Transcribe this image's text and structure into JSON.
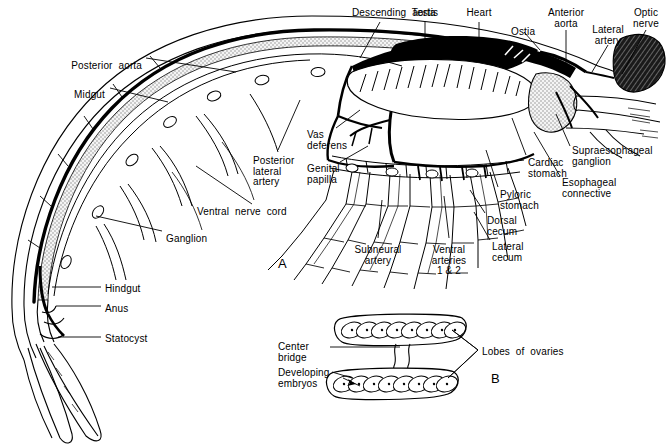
{
  "figure": {
    "background_color": "#ffffff",
    "ink_color": "#000000",
    "stipple_color": "#9a9a9a",
    "panels": [
      {
        "id": "A",
        "label": "A",
        "x": 278,
        "y": 256,
        "description": "Lateral view of whole shrimp showing circulatory, digestive and nervous systems"
      },
      {
        "id": "B",
        "label": "B",
        "x": 491,
        "y": 371,
        "description": "Detail of ovaries with developing embryos"
      }
    ]
  },
  "panel_a_labels": [
    {
      "key": "descending_aorta",
      "text": "Descending  aorta",
      "x": 352,
      "y": 8,
      "align": "left"
    },
    {
      "key": "testis",
      "text": "Testis",
      "x": 425,
      "y": 8,
      "align": "ctr"
    },
    {
      "key": "heart",
      "text": "Heart",
      "x": 479,
      "y": 8,
      "align": "ctr"
    },
    {
      "key": "ostia",
      "text": "Ostia",
      "x": 511,
      "y": 27,
      "align": "left"
    },
    {
      "key": "anterior_aorta",
      "text": "Anterior\naorta",
      "x": 566,
      "y": 8,
      "align": "ctr"
    },
    {
      "key": "lateral_artery",
      "text": "Lateral\nartery",
      "x": 608,
      "y": 25,
      "align": "ctr"
    },
    {
      "key": "optic_nerve",
      "text": "Optic\nnerve",
      "x": 646,
      "y": 8,
      "align": "ctr"
    },
    {
      "key": "posterior_aorta",
      "text": "Posterior  aorta",
      "x": 142,
      "y": 61,
      "align": "rt"
    },
    {
      "key": "midgut",
      "text": "Midgut",
      "x": 105,
      "y": 90,
      "align": "rt"
    },
    {
      "key": "vas_deferens",
      "text": "Vas\ndeferens",
      "x": 307,
      "y": 130,
      "align": "left"
    },
    {
      "key": "posterior_lateral_artery",
      "text": "Posterior\nlateral\nartery",
      "x": 253,
      "y": 156,
      "align": "left"
    },
    {
      "key": "genital_papilla",
      "text": "Genital\npapilla",
      "x": 307,
      "y": 164,
      "align": "left"
    },
    {
      "key": "ventral_nerve_cord",
      "text": "Ventral  nerve  cord",
      "x": 197,
      "y": 207,
      "align": "left"
    },
    {
      "key": "ganglion",
      "text": "Ganglion",
      "x": 166,
      "y": 234,
      "align": "left"
    },
    {
      "key": "hindgut",
      "text": "Hindgut",
      "x": 105,
      "y": 284,
      "align": "left"
    },
    {
      "key": "anus",
      "text": "Anus",
      "x": 105,
      "y": 304,
      "align": "left"
    },
    {
      "key": "statocyst",
      "text": "Statocyst",
      "x": 105,
      "y": 334,
      "align": "left"
    },
    {
      "key": "subneural_artery",
      "text": "Subneural\nartery",
      "x": 378,
      "y": 245,
      "align": "ctr"
    },
    {
      "key": "ventral_arteries",
      "text": "Ventral\narteries\n1 & 2",
      "x": 449,
      "y": 245,
      "align": "ctr"
    },
    {
      "key": "lateral_cecum",
      "text": "Lateral\ncecum",
      "x": 492,
      "y": 242,
      "align": "left"
    },
    {
      "key": "dorsal_cecum",
      "text": "Dorsal\ncecum",
      "x": 487,
      "y": 216,
      "align": "left"
    },
    {
      "key": "pyloric_stomach",
      "text": "Pyloric\nstomach",
      "x": 500,
      "y": 190,
      "align": "left"
    },
    {
      "key": "cardiac_stomach",
      "text": "Cardiac\nstomach",
      "x": 528,
      "y": 158,
      "align": "left"
    },
    {
      "key": "esophageal_connective",
      "text": "Esophageal\nconnective",
      "x": 562,
      "y": 178,
      "align": "left"
    },
    {
      "key": "supraesophageal_ganglion",
      "text": "Supraesophageal\nganglion",
      "x": 572,
      "y": 146,
      "align": "left"
    }
  ],
  "panel_b_labels": [
    {
      "key": "center_bridge",
      "text": "Center\nbridge",
      "x": 278,
      "y": 342,
      "align": "left"
    },
    {
      "key": "developing_embryos",
      "text": "Developing\nembryos",
      "x": 278,
      "y": 368,
      "align": "left"
    },
    {
      "key": "lobes_of_ovaries",
      "text": "Lobes  of  ovaries",
      "x": 482,
      "y": 347,
      "align": "left"
    }
  ],
  "panel_b_structure": {
    "upper_lobe_segments": 8,
    "lower_lobe_segments": 8,
    "bridge": "center bridge connecting upper and lower ovary lobes"
  }
}
